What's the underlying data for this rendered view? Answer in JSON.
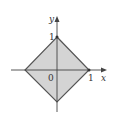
{
  "diagram": {
    "type": "region-plot",
    "fill_color": "#d4d4d4",
    "stroke_color": "#555555",
    "axes": {
      "x_label": "x",
      "y_label": "y",
      "origin_label": "0",
      "x_tick_label": "1",
      "y_tick_label": "1"
    },
    "vertices": [
      [
        0,
        1
      ],
      [
        1,
        0
      ],
      [
        0,
        -1
      ],
      [
        -1,
        0
      ]
    ]
  }
}
